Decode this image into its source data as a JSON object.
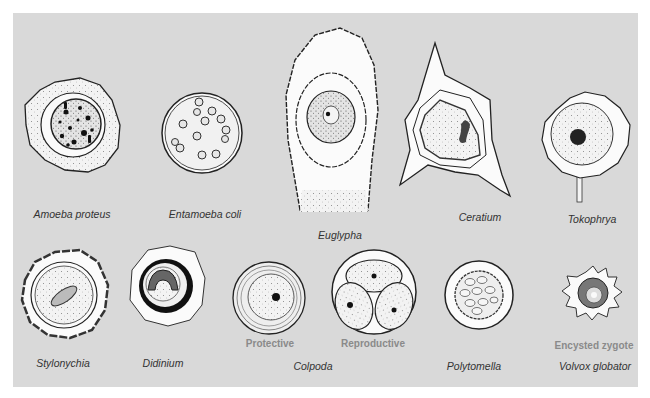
{
  "figure": {
    "background_color": "#d9d9d9",
    "row1": [
      {
        "name": "Amoeba proteus",
        "x": 72,
        "y": 210
      },
      {
        "name": "Entamoeba coli",
        "x": 205,
        "y": 210
      },
      {
        "name": "Euglypha",
        "x": 338,
        "y": 230
      },
      {
        "name": "Ceratium",
        "x": 480,
        "y": 213
      },
      {
        "name": "Tokophrya",
        "x": 592,
        "y": 215
      }
    ],
    "row2": [
      {
        "name": "Stylonychia",
        "x": 63,
        "y": 359
      },
      {
        "name": "Didinium",
        "x": 163,
        "y": 359
      },
      {
        "name": "Colpoda",
        "x": 312,
        "y": 362
      },
      {
        "name": "Polytomella",
        "x": 474,
        "y": 362
      },
      {
        "name": "Volvox globator",
        "x": 595,
        "y": 362
      }
    ],
    "sublabels": [
      {
        "text": "Protective",
        "x": 271,
        "y": 340
      },
      {
        "text": "Reproductive",
        "x": 373,
        "y": 340
      },
      {
        "text": "Encysted zygote",
        "x": 594,
        "y": 341
      }
    ]
  }
}
